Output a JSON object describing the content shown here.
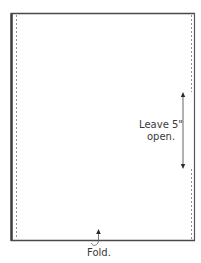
{
  "diagram": {
    "opening_label_line1": "Leave 5\"",
    "opening_label_line2": "open.",
    "fold_label": "Fold.",
    "colors": {
      "outline": "#3c3c3c",
      "stitch": "#8a8a8a",
      "arrow": "#3c3c3c",
      "text": "#3a3a3a"
    }
  }
}
